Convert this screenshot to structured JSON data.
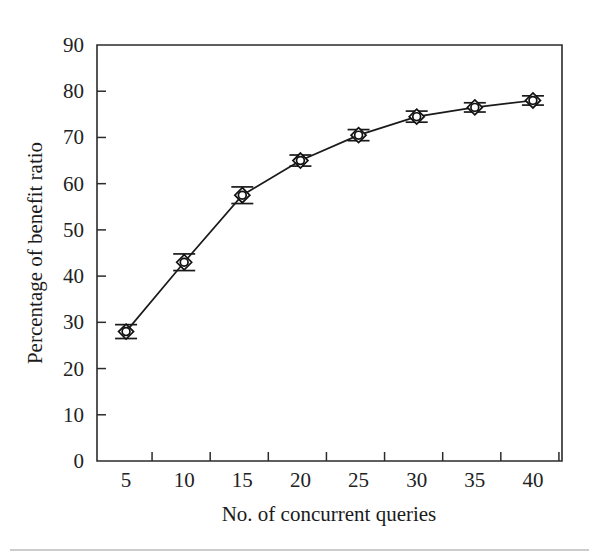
{
  "chart_data": {
    "type": "line",
    "title": "",
    "subtitle": "",
    "xlabel": "No. of concurrent queries",
    "ylabel": "Percentage of benefit ratio",
    "x": [
      5,
      10,
      15,
      20,
      25,
      30,
      35,
      40
    ],
    "values": [
      28,
      43,
      57.5,
      65,
      70.5,
      74.5,
      76.5,
      78
    ],
    "error_bars": [
      1.5,
      1.8,
      1.8,
      1.2,
      1.2,
      1.2,
      1.0,
      1.0
    ],
    "series": [
      {
        "name": "Percentage of benefit ratio",
        "values": [
          28,
          43,
          57.5,
          65,
          70.5,
          74.5,
          76.5,
          78
        ],
        "marker": "diamond-circle",
        "color": "#1a1a1a"
      }
    ],
    "xlim": [
      2.5,
      42.5
    ],
    "ylim": [
      0,
      90
    ],
    "xticks": [
      5,
      10,
      15,
      20,
      25,
      30,
      35,
      40
    ],
    "yticks": [
      0,
      10,
      20,
      30,
      40,
      50,
      60,
      70,
      80,
      90
    ],
    "xtick_labels": [
      "5",
      "10",
      "15",
      "20",
      "25",
      "30",
      "35",
      "40"
    ],
    "ytick_labels": [
      "0",
      "10",
      "20",
      "30",
      "40",
      "50",
      "60",
      "70",
      "80",
      "90"
    ],
    "grid": false,
    "legend": false,
    "legend_position": "none",
    "background_color": "#ffffff",
    "axis_color": "#2b2b2b",
    "line_color": "#1a1a1a"
  }
}
